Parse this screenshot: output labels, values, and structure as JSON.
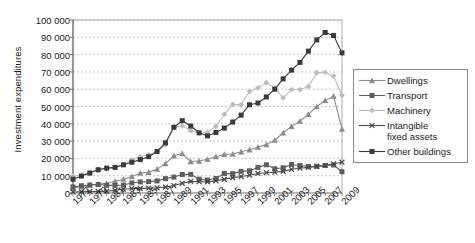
{
  "chart_data": {
    "type": "line",
    "title": "",
    "xlabel": "",
    "ylabel": "Investment expenditures",
    "grid": true,
    "legend_position": "right",
    "ylim": [
      0,
      100000
    ],
    "ytick_values": [
      0,
      10000,
      20000,
      30000,
      40000,
      50000,
      60000,
      70000,
      80000,
      90000,
      100000
    ],
    "ytick_labels": [
      "0",
      "10 000",
      "20 000",
      "30 000",
      "40 000",
      "50 000",
      "60 000",
      "70 000",
      "80 000",
      "90 000",
      "100 000"
    ],
    "x": [
      1977,
      1978,
      1979,
      1980,
      1981,
      1982,
      1983,
      1984,
      1985,
      1986,
      1987,
      1988,
      1989,
      1990,
      1991,
      1992,
      1993,
      1994,
      1995,
      1996,
      1997,
      1998,
      1999,
      2000,
      2001,
      2002,
      2003,
      2004,
      2005,
      2006,
      2007,
      2008,
      2009
    ],
    "xtick_labels": [
      "1977",
      "1979",
      "1981",
      "1983",
      "1985",
      "1987",
      "1989",
      "1991",
      "1993",
      "1995",
      "1997",
      "1999",
      "2001",
      "2003",
      "2005",
      "2007",
      "2009"
    ],
    "series": [
      {
        "name": "Dwellings",
        "color": "#8c8c8c",
        "marker": "triangle",
        "values": [
          3000,
          3600,
          4500,
          5200,
          5600,
          6800,
          8000,
          9500,
          11500,
          12000,
          13800,
          17000,
          21500,
          22800,
          18200,
          18500,
          19500,
          21000,
          22300,
          22500,
          23800,
          25000,
          26500,
          28000,
          30500,
          34800,
          38500,
          41500,
          45500,
          50000,
          53500,
          56000,
          37000
        ]
      },
      {
        "name": "Transport",
        "color": "#5e5e5e",
        "marker": "square",
        "values": [
          3500,
          4200,
          4600,
          4900,
          4400,
          4400,
          4600,
          5800,
          6400,
          6600,
          7000,
          8300,
          9200,
          10700,
          10800,
          8000,
          7500,
          8400,
          11300,
          11200,
          12500,
          12800,
          14800,
          16300,
          14000,
          14600,
          16500,
          15900,
          15300,
          15400,
          15900,
          16200,
          12300
        ]
      },
      {
        "name": "Machinery",
        "color": "#bdbdbd",
        "marker": "diamond",
        "values": [
          9800,
          10300,
          11900,
          13800,
          14000,
          14600,
          16200,
          19100,
          21000,
          22200,
          24000,
          27800,
          38200,
          38800,
          36000,
          34500,
          35000,
          38500,
          45500,
          51200,
          51000,
          58800,
          60800,
          63800,
          60800,
          55000,
          59800,
          59800,
          61500,
          69500,
          69700,
          67600,
          56500
        ]
      },
      {
        "name": "Intangible fixed assets",
        "color": "#4a4a4a",
        "marker": "x",
        "values": [
          600,
          700,
          800,
          900,
          1000,
          1500,
          2200,
          2600,
          2700,
          2800,
          3000,
          3400,
          4300,
          5600,
          6700,
          6500,
          6400,
          7000,
          7900,
          8900,
          9500,
          10300,
          11300,
          11700,
          12000,
          12500,
          13700,
          14300,
          14800,
          15400,
          15900,
          16900,
          17800
        ]
      },
      {
        "name": "Other buildings",
        "color": "#3a3a3a",
        "marker": "square",
        "values": [
          8000,
          9800,
          11500,
          13400,
          14400,
          14800,
          16300,
          17800,
          19300,
          21000,
          24000,
          29000,
          38000,
          41800,
          38700,
          34800,
          33000,
          35000,
          37500,
          41000,
          45000,
          51000,
          52000,
          55500,
          60000,
          66000,
          71000,
          75500,
          82000,
          88500,
          92800,
          91000,
          81000
        ]
      }
    ]
  },
  "legend": {
    "items": [
      {
        "label": "Dwellings"
      },
      {
        "label": "Transport"
      },
      {
        "label": "Machinery"
      },
      {
        "label": "Intangible",
        "label2": "fixed assets"
      },
      {
        "label": "Other buildings"
      }
    ]
  }
}
